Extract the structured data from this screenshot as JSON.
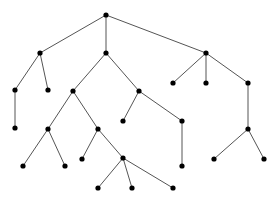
{
  "diagram": {
    "type": "tree",
    "width": 278,
    "height": 201,
    "colors": {
      "background": "#ffffff",
      "edge": "#555555",
      "node": "#000000"
    },
    "node_radius": 2.6,
    "nodes": [
      {
        "id": "n0",
        "x": 106,
        "y": 15
      },
      {
        "id": "n1",
        "x": 40,
        "y": 53
      },
      {
        "id": "n2",
        "x": 106,
        "y": 53
      },
      {
        "id": "n3",
        "x": 206,
        "y": 53
      },
      {
        "id": "n4",
        "x": 15,
        "y": 90
      },
      {
        "id": "n5",
        "x": 48,
        "y": 90
      },
      {
        "id": "n6",
        "x": 73,
        "y": 91
      },
      {
        "id": "n7",
        "x": 139,
        "y": 91
      },
      {
        "id": "n8",
        "x": 173,
        "y": 83
      },
      {
        "id": "n9",
        "x": 206,
        "y": 83
      },
      {
        "id": "n10",
        "x": 248,
        "y": 83
      },
      {
        "id": "n11",
        "x": 15,
        "y": 128
      },
      {
        "id": "n12",
        "x": 48,
        "y": 129
      },
      {
        "id": "n13",
        "x": 98,
        "y": 129
      },
      {
        "id": "n14",
        "x": 123,
        "y": 121
      },
      {
        "id": "n15",
        "x": 182,
        "y": 121
      },
      {
        "id": "n16",
        "x": 182,
        "y": 166
      },
      {
        "id": "n17",
        "x": 248,
        "y": 129
      },
      {
        "id": "n18",
        "x": 214,
        "y": 159
      },
      {
        "id": "n19",
        "x": 264,
        "y": 159
      },
      {
        "id": "n20",
        "x": 23,
        "y": 166
      },
      {
        "id": "n21",
        "x": 65,
        "y": 166
      },
      {
        "id": "n22",
        "x": 82,
        "y": 159
      },
      {
        "id": "n23",
        "x": 123,
        "y": 158
      },
      {
        "id": "n24",
        "x": 98,
        "y": 188
      },
      {
        "id": "n25",
        "x": 132,
        "y": 188
      },
      {
        "id": "n26",
        "x": 173,
        "y": 188
      }
    ],
    "edges": [
      [
        "n0",
        "n1"
      ],
      [
        "n0",
        "n2"
      ],
      [
        "n0",
        "n3"
      ],
      [
        "n1",
        "n4"
      ],
      [
        "n1",
        "n5"
      ],
      [
        "n2",
        "n6"
      ],
      [
        "n2",
        "n7"
      ],
      [
        "n3",
        "n8"
      ],
      [
        "n3",
        "n9"
      ],
      [
        "n3",
        "n10"
      ],
      [
        "n4",
        "n11"
      ],
      [
        "n6",
        "n12"
      ],
      [
        "n6",
        "n13"
      ],
      [
        "n7",
        "n14"
      ],
      [
        "n7",
        "n15"
      ],
      [
        "n15",
        "n16"
      ],
      [
        "n10",
        "n17"
      ],
      [
        "n17",
        "n18"
      ],
      [
        "n17",
        "n19"
      ],
      [
        "n12",
        "n20"
      ],
      [
        "n12",
        "n21"
      ],
      [
        "n13",
        "n22"
      ],
      [
        "n13",
        "n23"
      ],
      [
        "n23",
        "n24"
      ],
      [
        "n23",
        "n25"
      ],
      [
        "n23",
        "n26"
      ]
    ]
  }
}
